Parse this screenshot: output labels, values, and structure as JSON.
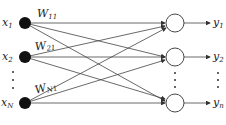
{
  "diagram": {
    "inputs": [
      {
        "var": "x",
        "sub": "1",
        "y": 23
      },
      {
        "var": "x",
        "sub": "2",
        "y": 57
      },
      {
        "var": "x",
        "sub": "N",
        "y": 103
      }
    ],
    "outputs": [
      {
        "var": "y",
        "sub": "1",
        "y": 23
      },
      {
        "var": "y",
        "sub": "2",
        "y": 57
      },
      {
        "var": "y",
        "sub": "n",
        "y": 103
      }
    ],
    "weights": [
      {
        "var": "W",
        "sub": "11"
      },
      {
        "var": "W",
        "sub": "21"
      },
      {
        "var": "W",
        "sub": "N1"
      }
    ],
    "ellipsis": "⋮",
    "colors": {
      "line": "#333333",
      "node_fill": "#111111"
    }
  }
}
